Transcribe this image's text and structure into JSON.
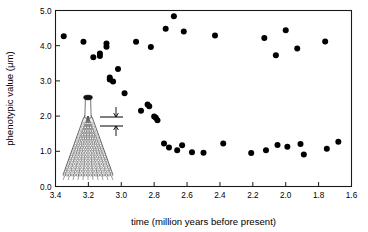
{
  "figure": {
    "background_color": "#ffffff",
    "point_color": "#000000",
    "axis_color": "#1a1a1a"
  },
  "inset": {
    "name": "fossil-specimen-illustration",
    "description": "conical microfossil specimen with measured trait span",
    "measure_annotation": "double-headed arrow spanning measured phenotypic trait"
  },
  "chart_data": {
    "type": "scatter",
    "title": "",
    "xlabel": "time (million years before present)",
    "ylabel": "phenotypic value (μm)",
    "xlim": [
      3.4,
      1.6
    ],
    "ylim": [
      0.0,
      5.0
    ],
    "x_reversed": true,
    "grid": false,
    "legend": null,
    "xticks": [
      3.4,
      3.2,
      3.0,
      2.8,
      2.6,
      2.4,
      2.2,
      2.0,
      1.8,
      1.6
    ],
    "xtick_labels": [
      "3.4",
      "3.2",
      "3.0",
      "2.8",
      "2.6",
      "2.4",
      "2.2",
      "2.0",
      "1.8",
      "1.6"
    ],
    "yticks": [
      0.0,
      1.0,
      2.0,
      3.0,
      4.0,
      5.0
    ],
    "ytick_labels": [
      "0.0",
      "1.0",
      "2.0",
      "3.0",
      "4.0",
      "5.0"
    ],
    "marker": "filled-circle",
    "marker_size_px": 4.2,
    "series": [
      {
        "name": "phenotypic value",
        "points": [
          [
            3.35,
            4.27
          ],
          [
            3.23,
            4.11
          ],
          [
            3.17,
            3.67
          ],
          [
            3.13,
            3.78
          ],
          [
            3.13,
            3.71
          ],
          [
            3.09,
            4.06
          ],
          [
            3.09,
            3.97
          ],
          [
            3.07,
            3.1
          ],
          [
            3.07,
            3.04
          ],
          [
            3.05,
            2.98
          ],
          [
            3.02,
            3.34
          ],
          [
            2.98,
            2.65
          ],
          [
            2.91,
            4.11
          ],
          [
            2.88,
            2.15
          ],
          [
            2.84,
            2.33
          ],
          [
            2.83,
            2.28
          ],
          [
            2.82,
            3.96
          ],
          [
            2.8,
            1.99
          ],
          [
            2.79,
            1.95
          ],
          [
            2.78,
            1.88
          ],
          [
            2.74,
            1.22
          ],
          [
            2.73,
            4.48
          ],
          [
            2.71,
            1.11
          ],
          [
            2.68,
            4.84
          ],
          [
            2.66,
            1.03
          ],
          [
            2.63,
            1.17
          ],
          [
            2.62,
            4.4
          ],
          [
            2.57,
            0.97
          ],
          [
            2.5,
            0.96
          ],
          [
            2.43,
            4.29
          ],
          [
            2.38,
            1.22
          ],
          [
            2.21,
            0.95
          ],
          [
            2.13,
            4.22
          ],
          [
            2.12,
            1.03
          ],
          [
            2.06,
            3.73
          ],
          [
            2.05,
            1.18
          ],
          [
            2.0,
            4.44
          ],
          [
            1.99,
            1.13
          ],
          [
            1.93,
            3.92
          ],
          [
            1.91,
            1.21
          ],
          [
            1.89,
            0.91
          ],
          [
            1.76,
            4.12
          ],
          [
            1.75,
            1.07
          ],
          [
            1.68,
            1.27
          ]
        ]
      }
    ]
  }
}
